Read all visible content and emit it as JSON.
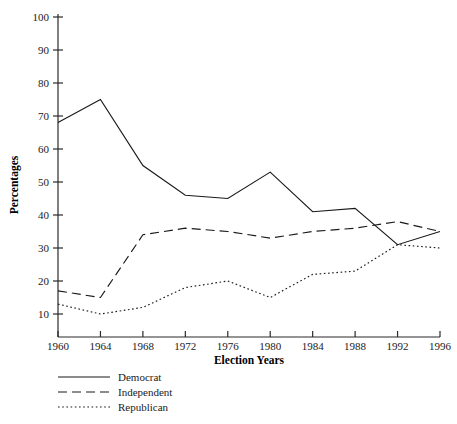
{
  "chart_data": {
    "type": "line",
    "title": "",
    "xlabel": "Election Years",
    "ylabel": "Percentages",
    "x": [
      1960,
      1964,
      1968,
      1972,
      1976,
      1980,
      1984,
      1988,
      1992,
      1996
    ],
    "categories": [
      "1960",
      "1964",
      "1968",
      "1972",
      "1976",
      "1980",
      "1984",
      "1988",
      "1992",
      "1996"
    ],
    "xlim": [
      1960,
      1996
    ],
    "ylim": [
      0,
      100
    ],
    "yticks": [
      10,
      20,
      30,
      40,
      50,
      60,
      70,
      80,
      90,
      100
    ],
    "ytick_labels": [
      "10",
      "20",
      "30",
      "40",
      "50",
      "60",
      "70",
      "80",
      "90",
      "100"
    ],
    "grid": false,
    "legend_position": "below-left",
    "series": [
      {
        "name": "Democrat",
        "style": "solid",
        "values": [
          68,
          75,
          55,
          46,
          45,
          53,
          41,
          42,
          31,
          35
        ]
      },
      {
        "name": "Independent",
        "style": "dashed",
        "values": [
          17,
          15,
          34,
          36,
          35,
          33,
          35,
          36,
          38,
          35
        ]
      },
      {
        "name": "Republican",
        "style": "dotted",
        "values": [
          13,
          10,
          12,
          18,
          20,
          15,
          22,
          23,
          31,
          30
        ]
      }
    ]
  },
  "axis": {
    "y_title": "Percentages",
    "x_title": "Election Years"
  },
  "legend": {
    "items": [
      {
        "label": "Democrat",
        "style": "solid"
      },
      {
        "label": "Independent",
        "style": "dashed"
      },
      {
        "label": "Republican",
        "style": "dotted"
      }
    ]
  }
}
